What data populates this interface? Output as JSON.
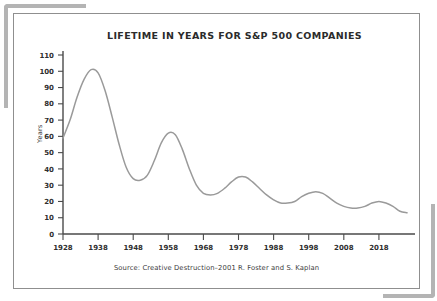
{
  "figure": {
    "title": "LIFETIME IN YEARS FOR S&P 500 COMPANIES",
    "source": "Source: Creative Destruction–2001 R. Foster and S. Kaplan",
    "ylabel": "Years",
    "line_color": "#9a9a9a",
    "axis_color": "#4a4a4a",
    "border_color": "#8f8f8f",
    "bracket_color": "#b4b4b4",
    "background_color": "#ffffff"
  },
  "chart_data": {
    "type": "line",
    "title": "LIFETIME IN YEARS FOR S&P 500 COMPANIES",
    "subtitle": "",
    "xlabel": "",
    "ylabel": "Years",
    "xlim": [
      1928,
      2026
    ],
    "ylim": [
      0,
      110
    ],
    "grid": false,
    "legend": "none",
    "annotations": [
      "Source: Creative Destruction–2001 R. Foster and S. Kaplan"
    ],
    "yticks": [
      0,
      10,
      20,
      30,
      40,
      50,
      60,
      70,
      80,
      90,
      100,
      110
    ],
    "xticks": [
      1928,
      1938,
      1948,
      1958,
      1968,
      1978,
      1988,
      1998,
      2008,
      2018
    ],
    "series": [
      {
        "name": "Average company lifetime (years)",
        "x": [
          1928,
          1930,
          1932,
          1934,
          1936,
          1938,
          1940,
          1942,
          1944,
          1946,
          1948,
          1950,
          1952,
          1954,
          1956,
          1958,
          1960,
          1962,
          1964,
          1966,
          1968,
          1970,
          1972,
          1974,
          1976,
          1978,
          1980,
          1982,
          1984,
          1986,
          1988,
          1990,
          1992,
          1994,
          1996,
          1998,
          2000,
          2002,
          2004,
          2006,
          2008,
          2010,
          2012,
          2014,
          2016,
          2018,
          2020,
          2022,
          2024,
          2026
        ],
        "values": [
          59,
          70,
          84,
          95,
          101,
          99,
          88,
          72,
          55,
          41,
          34,
          33,
          36,
          45,
          56,
          62,
          61,
          52,
          40,
          30,
          25,
          24,
          25,
          28,
          32,
          35,
          35,
          32,
          28,
          24,
          21,
          19,
          19,
          20,
          23,
          25,
          26,
          25,
          22,
          19,
          17,
          16,
          16,
          17,
          19,
          20,
          19,
          17,
          14,
          13
        ]
      }
    ]
  }
}
